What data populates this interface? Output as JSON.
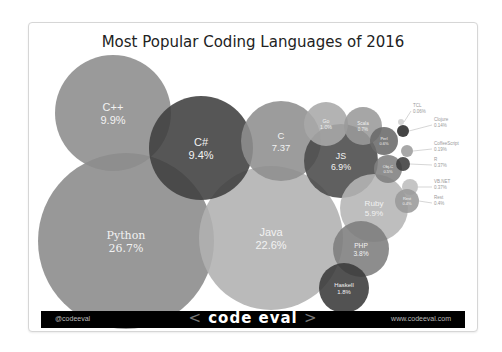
{
  "title": "Most Popular Coding Languages of 2016",
  "footer": {
    "handle": "@codeeval",
    "logo_left": "<",
    "logo_text": "code eval",
    "logo_right": ">",
    "site": "www.codeeval.com"
  },
  "chart_data": {
    "type": "bubble",
    "title": "Most Popular Coding Languages of 2016",
    "unit": "%",
    "series": [
      {
        "name": "Python",
        "value": 26.7,
        "label": "26.7%",
        "cx": 97,
        "cy": 218,
        "r": 88,
        "color": "#8a8a8a"
      },
      {
        "name": "Java",
        "value": 22.6,
        "label": "22.6%",
        "cx": 242,
        "cy": 215,
        "r": 72,
        "color": "#b0b0b0"
      },
      {
        "name": "C++",
        "value": 9.9,
        "label": "9.9%",
        "cx": 84,
        "cy": 90,
        "r": 58,
        "color": "#8c8c8c"
      },
      {
        "name": "C#",
        "value": 9.4,
        "label": "9.4%",
        "cx": 172,
        "cy": 125,
        "r": 52,
        "color": "#3f3f3f"
      },
      {
        "name": "C",
        "value": 7.37,
        "label": "7.37",
        "cx": 252,
        "cy": 118,
        "r": 40,
        "color": "#8e8e8e"
      },
      {
        "name": "JS",
        "value": 6.9,
        "label": "6.9%",
        "cx": 312,
        "cy": 138,
        "r": 37,
        "color": "#4a4a4a"
      },
      {
        "name": "Ruby",
        "value": 5.9,
        "label": "5.9%",
        "cx": 345,
        "cy": 185,
        "r": 34,
        "color": "#b5b5b5"
      },
      {
        "name": "PHP",
        "value": 3.8,
        "label": "3.8%",
        "cx": 332,
        "cy": 226,
        "r": 28,
        "color": "#7d7d7d"
      },
      {
        "name": "Haskell",
        "value": 1.8,
        "label": "1.8%",
        "cx": 315,
        "cy": 265,
        "r": 25,
        "color": "#3a3a3a"
      },
      {
        "name": "Go",
        "value": 1.0,
        "label": "1.0%",
        "cx": 297,
        "cy": 101,
        "r": 22,
        "color": "#a8a8a8"
      },
      {
        "name": "Scala",
        "value": 0.7,
        "label": "0.7%",
        "cx": 334,
        "cy": 103,
        "r": 19,
        "color": "#9a9a9a"
      },
      {
        "name": "Perl",
        "value": 0.6,
        "label": "0.6%",
        "cx": 355,
        "cy": 118,
        "r": 14,
        "color": "#6a6a6a"
      },
      {
        "name": "Obj-C",
        "value": 0.5,
        "label": "0.5%",
        "cx": 359,
        "cy": 146,
        "r": 14,
        "color": "#808080"
      },
      {
        "name": "TCL",
        "value": 0.06,
        "label": "0.06%",
        "cx": 372,
        "cy": 99,
        "r": 3,
        "color": "#cfcfcf"
      },
      {
        "name": "Clojure",
        "value": 0.14,
        "label": "0.14%",
        "cx": 374,
        "cy": 108,
        "r": 6,
        "color": "#2a2a2a"
      },
      {
        "name": "CoffeeScript",
        "value": 0.19,
        "label": "0.19%",
        "cx": 378,
        "cy": 128,
        "r": 6,
        "color": "#9c9c9c"
      },
      {
        "name": "R",
        "value": 0.37,
        "label": "0.37%",
        "cx": 374,
        "cy": 141,
        "r": 7,
        "color": "#3c3c3c"
      },
      {
        "name": "VB.NET",
        "value": 0.37,
        "label": "0.37%",
        "cx": 381,
        "cy": 164,
        "r": 8,
        "color": "#bdbdbd"
      },
      {
        "name": "Rest",
        "value": 0.4,
        "label": "0.4%",
        "cx": 378,
        "cy": 178,
        "r": 12,
        "color": "#9a9a9a"
      }
    ],
    "callouts": [
      {
        "name": "TCL",
        "label": "0.06%",
        "x": 384,
        "y": 84
      },
      {
        "name": "Clojure",
        "label": "0.14%",
        "x": 405,
        "y": 98
      },
      {
        "name": "CoffeeScript",
        "label": "0.19%",
        "x": 405,
        "y": 122
      },
      {
        "name": "R",
        "label": "0.37%",
        "x": 405,
        "y": 138
      },
      {
        "name": "VB.NET",
        "label": "0.37%",
        "x": 405,
        "y": 160
      },
      {
        "name": "Rest",
        "label": "0.4%",
        "x": 405,
        "y": 176
      }
    ]
  }
}
